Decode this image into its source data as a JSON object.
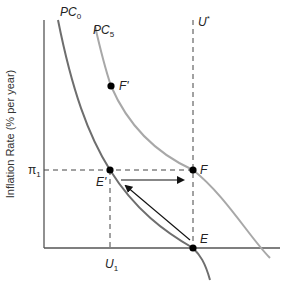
{
  "diagram": {
    "y_axis_label": "Inflation Rate (% per year)",
    "curves": [
      {
        "name": "PC",
        "subscript": "0",
        "color": "#6e6e6e"
      },
      {
        "name": "PC",
        "subscript": "5",
        "color": "#a8a8a8"
      }
    ],
    "natural_rate_label": {
      "name": "U",
      "superscript": "*"
    },
    "x_tick": {
      "name": "U",
      "subscript": "1"
    },
    "y_tick": {
      "name": "π",
      "subscript": "1"
    },
    "points": [
      {
        "label": "F'",
        "curve": "PC5"
      },
      {
        "label": "E'",
        "curve": "PC0"
      },
      {
        "label": "F",
        "curve": "PC5"
      },
      {
        "label": "E",
        "curve": "PC0"
      }
    ],
    "arrows": [
      {
        "from": "E",
        "to": "E'"
      },
      {
        "from": "E'",
        "to": "F"
      }
    ],
    "colors": {
      "axis": "#555555",
      "dashed": "#444444",
      "pc0": "#6e6e6e",
      "pc5": "#a8a8a8",
      "point": "#000000"
    }
  }
}
